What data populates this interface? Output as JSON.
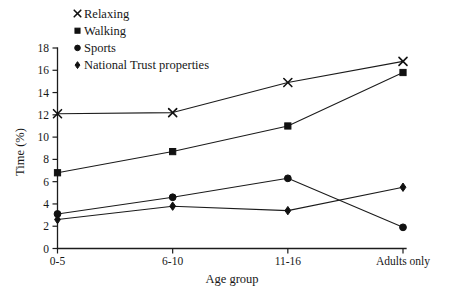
{
  "chart_data": {
    "type": "line",
    "title": "",
    "xlabel": "Age group",
    "ylabel": "Time (%)",
    "categories": [
      "0-5",
      "6-10",
      "11-16",
      "Adults only"
    ],
    "ylim": [
      0,
      18
    ],
    "yticks": [
      0,
      2,
      4,
      6,
      8,
      10,
      12,
      14,
      16,
      18
    ],
    "grid": false,
    "legend_position": "top-left",
    "series": [
      {
        "name": "Relaxing",
        "marker": "x",
        "values": [
          12.1,
          12.2,
          14.9,
          16.8
        ]
      },
      {
        "name": "Walking",
        "marker": "square",
        "values": [
          6.8,
          8.7,
          11.0,
          15.8
        ]
      },
      {
        "name": "Sports",
        "marker": "circle",
        "values": [
          3.1,
          4.6,
          6.3,
          1.9
        ]
      },
      {
        "name": "National Trust properties",
        "marker": "diamond",
        "values": [
          2.6,
          3.8,
          3.4,
          5.5
        ]
      }
    ]
  },
  "axes": {
    "y_title": "Time (%)",
    "x_title": "Age group",
    "y_tick_labels": [
      "0",
      "2",
      "4",
      "6",
      "8",
      "10",
      "12",
      "14",
      "16",
      "18"
    ],
    "x_tick_labels": [
      "0-5",
      "6-10",
      "11-16",
      "Adults only"
    ]
  },
  "legend": {
    "items": [
      {
        "label": "Relaxing",
        "marker_icon": "cross-marker-icon"
      },
      {
        "label": "Walking",
        "marker_icon": "square-marker-icon"
      },
      {
        "label": "Sports",
        "marker_icon": "circle-marker-icon"
      },
      {
        "label": "National Trust properties",
        "marker_icon": "diamond-marker-icon"
      }
    ]
  }
}
